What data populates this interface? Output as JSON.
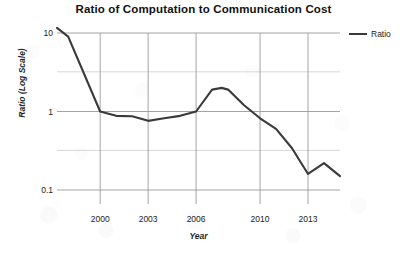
{
  "chart_data": {
    "type": "line",
    "title": "Ratio of Computation to Communication Cost",
    "xlabel": "Year",
    "ylabel": "Ratio (Log Scale)",
    "yscale": "log",
    "ylim": [
      0.1,
      10
    ],
    "xlim": [
      1997.3,
      2015.0
    ],
    "grid": true,
    "legend_position": "right",
    "y_ticks": [
      {
        "value": 10,
        "label": "10"
      },
      {
        "value": 1,
        "label": "1"
      },
      {
        "value": 0.1,
        "label": "0.1"
      }
    ],
    "y_minor_gridlines": [
      3.2,
      0.32
    ],
    "x_ticks": [
      {
        "value": 2000,
        "label": "2000"
      },
      {
        "value": 2003,
        "label": "2003"
      },
      {
        "value": 2006,
        "label": "2006"
      },
      {
        "value": 2010,
        "label": "2010"
      },
      {
        "value": 2013,
        "label": "2013"
      }
    ],
    "x_gridlines": [
      2000,
      2003,
      2006,
      2010,
      2013
    ],
    "series": [
      {
        "name": "Ratio",
        "color": "#3a3a3a",
        "x": [
          1997.3,
          1998.0,
          2000.0,
          2001.0,
          2002.0,
          2003.0,
          2004.0,
          2005.0,
          2006.0,
          2007.0,
          2007.6,
          2008.0,
          2009.0,
          2010.0,
          2011.0,
          2012.0,
          2013.0,
          2014.0,
          2015.0
        ],
        "values": [
          11.6,
          9.0,
          1.0,
          0.88,
          0.87,
          0.76,
          0.82,
          0.88,
          1.0,
          1.9,
          2.0,
          1.9,
          1.2,
          0.82,
          0.6,
          0.34,
          0.16,
          0.22,
          0.15
        ]
      }
    ]
  },
  "legend": {
    "entries": [
      {
        "label": "Ratio"
      }
    ]
  }
}
